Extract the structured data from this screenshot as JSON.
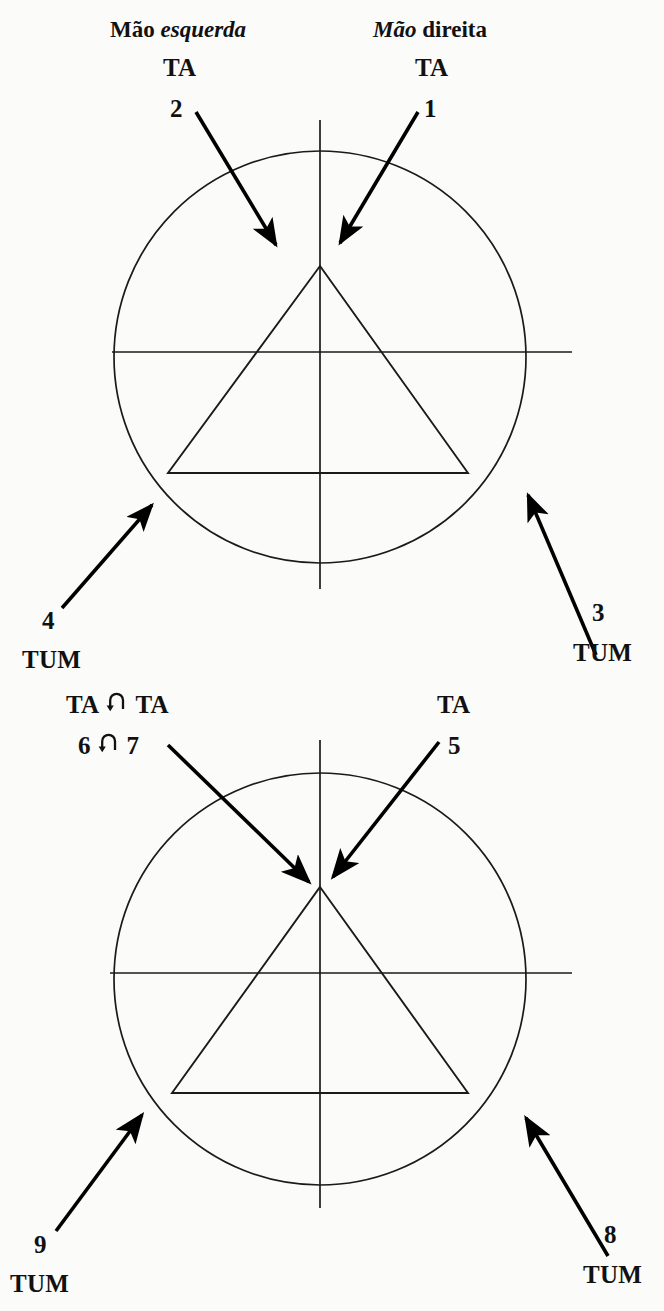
{
  "figure": {
    "headers": [
      {
        "id": "left-hand",
        "prefix": "Mão ",
        "emphasis": "esquerda",
        "suffix": ""
      },
      {
        "id": "right-hand",
        "prefix": "",
        "emphasis": "Mão",
        "suffix": " direita"
      }
    ],
    "line_color": "#1a1a1a",
    "arrow_color": "#000000",
    "background_color": "#fbfbf9"
  },
  "diagrams": [
    {
      "id": "diagram-upper",
      "circle": {
        "cx": 320,
        "cy": 357,
        "r": 206
      },
      "axes": {
        "horizontal": {
          "x1": 112,
          "y1": 352,
          "x2": 572,
          "y2": 352
        },
        "vertical": {
          "x1": 320,
          "y1": 120,
          "x2": 320,
          "y2": 589
        }
      },
      "triangle": {
        "apex_x": 320,
        "apex_y": 266,
        "left_x": 168,
        "right_x": 468,
        "base_y": 473
      },
      "labels": [
        {
          "id": "label-1",
          "code": "TA",
          "number": "1",
          "position": "top-right"
        },
        {
          "id": "label-2",
          "code": "TA",
          "number": "2",
          "position": "top-left"
        },
        {
          "id": "label-3",
          "code": "TUM",
          "number": "3",
          "position": "bottom-right"
        },
        {
          "id": "label-4",
          "code": "TUM",
          "number": "4",
          "position": "bottom-left"
        }
      ]
    },
    {
      "id": "diagram-lower",
      "circle": {
        "cx": 320,
        "cy": 979,
        "r": 206
      },
      "axes": {
        "horizontal": {
          "x1": 110,
          "y1": 973,
          "x2": 572,
          "y2": 973
        },
        "vertical": {
          "x1": 320,
          "y1": 740,
          "x2": 320,
          "y2": 1208
        }
      },
      "triangle": {
        "apex_x": 320,
        "apex_y": 887,
        "left_x": 172,
        "right_x": 468,
        "base_y": 1093
      },
      "labels": [
        {
          "id": "label-5",
          "code": "TA",
          "number": "5",
          "position": "top-right"
        },
        {
          "id": "label-6",
          "code": "TA",
          "number": "6",
          "position": "top-left-outer"
        },
        {
          "id": "label-7",
          "code": "TA",
          "number": "7",
          "position": "top-left-inner"
        },
        {
          "id": "label-8",
          "code": "TUM",
          "number": "8",
          "position": "bottom-right"
        },
        {
          "id": "label-9",
          "code": "TUM",
          "number": "9",
          "position": "bottom-left"
        }
      ],
      "link_symbol": "u-turn-arrow"
    }
  ],
  "text": {
    "ta": "TA",
    "tum": "TUM",
    "n1": "1",
    "n2": "2",
    "n3": "3",
    "n4": "4",
    "n5": "5",
    "n6": "6",
    "n7": "7",
    "n8": "8",
    "n9": "9",
    "mao": "Mão",
    "esquerda": "esquerda",
    "direita": "direita",
    "mao_esquerda_prefix": "Mão ",
    "mao_direita_suffix": " direita"
  }
}
